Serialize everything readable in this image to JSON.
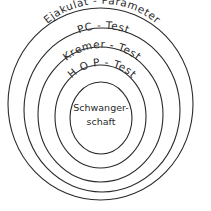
{
  "diagram": {
    "type": "concentric-circles",
    "stroke_color": "#2a2a2a",
    "background": "#ffffff",
    "rings": [
      {
        "label": "Ejakulat - Parameter"
      },
      {
        "label": "PC - Test"
      },
      {
        "label": "Kremer - Test"
      },
      {
        "label": "H O P - Test"
      }
    ],
    "center": {
      "line1": "Schwanger-",
      "line2": "schaft"
    }
  }
}
